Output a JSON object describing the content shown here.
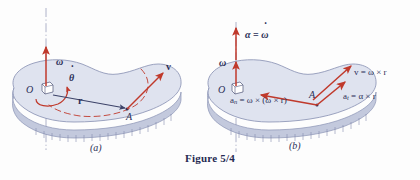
{
  "figure": {
    "caption": "Figure 5/4",
    "colors": {
      "vector_red": "#c0392b",
      "body_fill": "#dfe3ef",
      "body_edge": "#8b93b5",
      "body_side": "#c3c9dd",
      "axis_line": "#9aa0bb",
      "label_ink": "#2b2f57",
      "background": "#fdfdfd"
    }
  },
  "panel_a": {
    "sublabel": "(a)",
    "labels": {
      "omega": "ω",
      "theta_dot": "θ",
      "origin": "O",
      "r": "r",
      "point_A": "A",
      "v": "v"
    }
  },
  "panel_b": {
    "sublabel": "(b)",
    "labels": {
      "alpha_eq_omega_dot_alpha": "α",
      "alpha_eq_omega_dot_eq": "=",
      "alpha_eq_omega_dot_omega": "ω",
      "omega": "ω",
      "origin": "O",
      "point_A": "A",
      "a_n_symbol": "a",
      "a_n_subscript": "n",
      "a_n_expression": "= ω × (ω × r)",
      "a_t_symbol": "a",
      "a_t_subscript": "t",
      "a_t_expression": "= α × r",
      "v_symbol": "v",
      "v_expression": "= ω × r"
    }
  }
}
